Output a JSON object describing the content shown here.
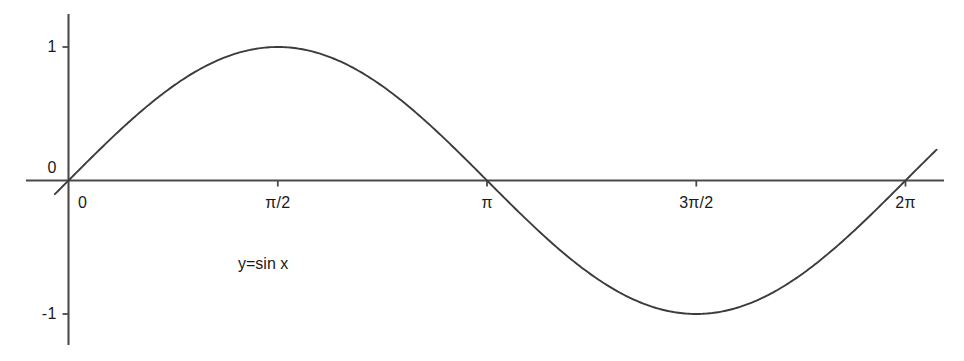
{
  "chart_data": {
    "type": "line",
    "title": "",
    "subtitle": "",
    "xlabel": "",
    "ylabel": "",
    "annotation": "y=sin x",
    "function": "y = sin x",
    "grid": false,
    "legend": false,
    "legend_position": "none",
    "xlim": [
      -0.1026,
      6.5164
    ],
    "ylim": [
      -1.2706,
      1.2481
    ],
    "x_tick_labels": [
      "0",
      "π/2",
      "π",
      "3π/2",
      "2π"
    ],
    "x_tick_values": [
      0,
      1.5708,
      3.1416,
      4.7124,
      6.2832
    ],
    "y_tick_labels": [
      "1",
      "0",
      "-1"
    ],
    "y_tick_values": [
      1,
      0,
      -1
    ],
    "series": [
      {
        "name": "y=sin x",
        "color": "#3c3c3c",
        "x": [
          -0.1026,
          0,
          0.3927,
          0.7854,
          1.1781,
          1.5708,
          1.9635,
          2.3562,
          2.7489,
          3.1416,
          3.5343,
          3.927,
          4.3197,
          4.7124,
          5.1051,
          5.4978,
          5.8905,
          6.2832,
          6.5164
        ],
        "y": [
          -0.1024,
          0,
          0.3827,
          0.7071,
          0.9239,
          1,
          0.9239,
          0.7071,
          0.3827,
          0,
          -0.3827,
          -0.7071,
          -0.9239,
          -1,
          -0.9239,
          -0.7071,
          -0.3827,
          0,
          0.2311
        ]
      }
    ]
  },
  "axes": {
    "x_axis_name": "x-axis",
    "y_axis_name": "y-axis",
    "axis_color": "#4a4a4a"
  },
  "labels": {
    "x": [
      {
        "text": "0",
        "value": 0
      },
      {
        "text": "π/2",
        "value": 1.5708
      },
      {
        "text": "π",
        "value": 3.1416
      },
      {
        "text": "3π/2",
        "value": 4.7124
      },
      {
        "text": "2π",
        "value": 6.2832
      }
    ],
    "y": [
      {
        "text": "1",
        "value": 1
      },
      {
        "text": "0",
        "value": 0
      },
      {
        "text": "-1",
        "value": -1
      }
    ]
  },
  "annotation": {
    "formula": "y=sin x"
  },
  "colors": {
    "background": "#ffffff",
    "curve": "#3c3c3c",
    "axis": "#4a4a4a",
    "text": "#1a1a1a"
  }
}
